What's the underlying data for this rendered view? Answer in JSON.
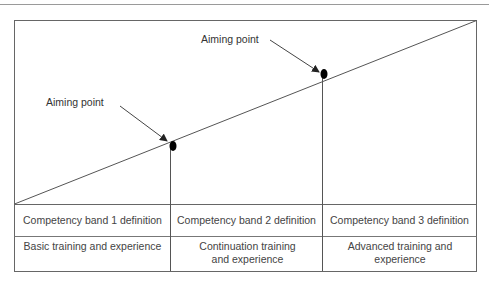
{
  "diagram": {
    "aiming_points": [
      {
        "label": "Aiming point",
        "x": 174,
        "y": 147
      },
      {
        "label": "Aiming point",
        "x": 324,
        "y": 75
      }
    ],
    "table": {
      "rows": [
        [
          "Competency band 1 definition",
          "Competency band 2 definition",
          "Competency band 3 definition"
        ],
        [
          "Basic training and experience",
          "Continuation training and experience",
          "Advanced training and experience"
        ]
      ]
    },
    "colors": {
      "line": "#555555",
      "border": "#666666",
      "dot": "#000000",
      "text": "#333333"
    }
  }
}
